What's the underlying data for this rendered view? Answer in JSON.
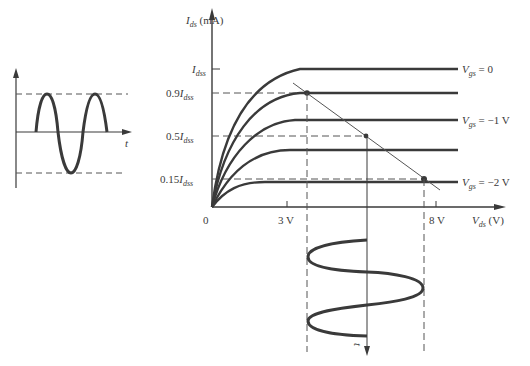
{
  "input_signal": {
    "time_label": "t"
  },
  "characteristic": {
    "y_axis": {
      "symbol": "I",
      "subscript": "ds",
      "unit": " (mA)"
    },
    "x_axis": {
      "symbol": "V",
      "subscript": "ds",
      "unit": " (V)"
    },
    "origin_label": "0",
    "y_levels": [
      {
        "prefix": "",
        "symbol": "I",
        "subscript": "dss"
      },
      {
        "prefix": "0.9",
        "symbol": "I",
        "subscript": "dss"
      },
      {
        "prefix": "0.5",
        "symbol": "I",
        "subscript": "dss"
      },
      {
        "prefix": "0.15",
        "symbol": "I",
        "subscript": "dss"
      }
    ],
    "x_ticks": [
      "3 V",
      "8 V"
    ],
    "curve_labels": [
      {
        "symbol": "V",
        "subscript": "gs",
        "value": " = 0"
      },
      {
        "symbol": "V",
        "subscript": "gs",
        "value": " = −1 V"
      },
      {
        "symbol": "V",
        "subscript": "gs",
        "value": " = −2 V"
      }
    ]
  },
  "output_signal": {
    "time_label": "t"
  },
  "colors": {
    "stroke": "#3a3a3a",
    "thin": "#555555"
  }
}
